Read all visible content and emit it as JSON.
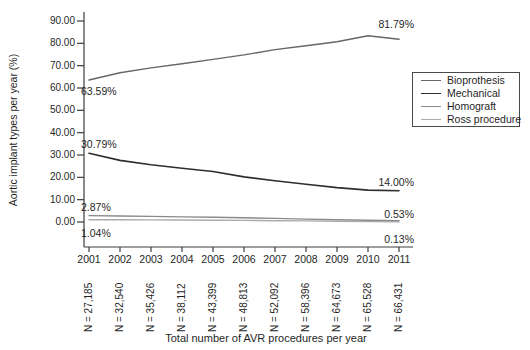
{
  "figure": {
    "background": "#ffffff",
    "text_color": "#1f1f1f",
    "axis_color": "#3c3c3c"
  },
  "chart_data": {
    "type": "line",
    "title": "",
    "ylabel": "Aortic implant types per year (%)",
    "xlabel": "Total number of AVR procedures per year",
    "ylim": [
      0,
      90
    ],
    "grid": false,
    "legend_position": "right",
    "y_tick_labels": [
      "90.00",
      "80.00",
      "70.00",
      "60.00",
      "50.00",
      "40.00",
      "30.00",
      "20.00",
      "10.00",
      "0.00"
    ],
    "x_categories": [
      "2001",
      "2002",
      "2003",
      "2004",
      "2005",
      "2006",
      "2007",
      "2008",
      "2009",
      "2010",
      "2011"
    ],
    "n_labels": [
      "N = 27,185",
      "N = 32,540",
      "N = 35,426",
      "N = 38,112",
      "N = 43,399",
      "N = 48,813",
      "N = 52,092",
      "N = 58,396",
      "N = 64,673",
      "N = 65,528",
      "N = 66,431"
    ],
    "series": [
      {
        "name": "Bioprothesis",
        "color": "#666666",
        "width": 1.4,
        "values": [
          63.59,
          66.8,
          69.0,
          70.9,
          72.8,
          74.8,
          77.2,
          78.9,
          80.7,
          83.4,
          81.79
        ]
      },
      {
        "name": "Mechanical",
        "color": "#2e2e2e",
        "width": 1.6,
        "values": [
          30.79,
          27.6,
          25.6,
          24.1,
          22.6,
          20.2,
          18.5,
          16.9,
          15.4,
          14.3,
          14.0
        ]
      },
      {
        "name": "Homograft",
        "color": "#8a8a8a",
        "width": 1.4,
        "values": [
          2.87,
          2.7,
          2.5,
          2.3,
          2.1,
          1.9,
          1.6,
          1.3,
          1.0,
          0.8,
          0.53
        ]
      },
      {
        "name": "Ross procedure",
        "color": "#ababab",
        "width": 1.4,
        "values": [
          1.04,
          1.0,
          0.95,
          0.9,
          0.8,
          0.7,
          0.6,
          0.5,
          0.35,
          0.2,
          0.13
        ]
      }
    ],
    "annotations": [
      {
        "text": "63.59%",
        "series": 0,
        "point": "first",
        "side": "below",
        "offset": 0
      },
      {
        "text": "81.79%",
        "series": 0,
        "point": "last",
        "side": "above",
        "offset": -6
      },
      {
        "text": "30.79%",
        "series": 1,
        "point": "first",
        "side": "above",
        "offset": 0
      },
      {
        "text": "14.00%",
        "series": 1,
        "point": "last",
        "side": "above",
        "offset": 0
      },
      {
        "text": "2.87%",
        "series": 2,
        "point": "first",
        "side": "above",
        "offset": 0
      },
      {
        "text": "0.53%",
        "series": 2,
        "point": "last",
        "side": "above",
        "offset": 2
      },
      {
        "text": "1.04%",
        "series": 3,
        "point": "first",
        "side": "below",
        "offset": 2
      },
      {
        "text": "0.13%",
        "series": 3,
        "point": "last",
        "side": "below",
        "offset": 6
      }
    ]
  }
}
